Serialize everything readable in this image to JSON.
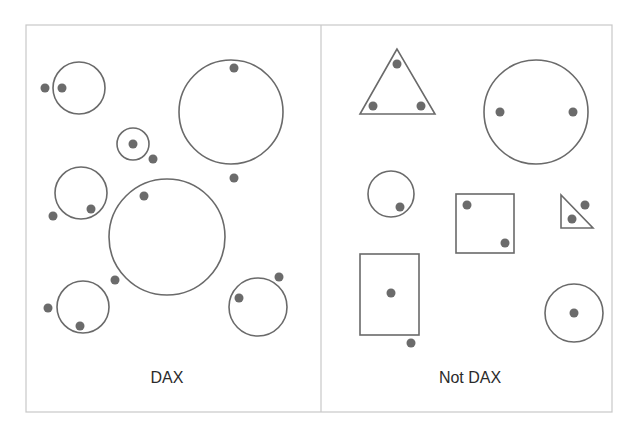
{
  "colors": {
    "stroke": "#6a6a6a",
    "dot": "#6b6b6b",
    "frame": "#c8c8c8",
    "text": "#2b2b2b",
    "background": "#ffffff"
  },
  "frame": {
    "x": 26,
    "y": 25,
    "width": 586,
    "height": 387,
    "divider_x": 321
  },
  "panels": [
    {
      "id": "dax",
      "label": "DAX",
      "shapes": [
        {
          "type": "circle",
          "cx": 79,
          "cy": 88,
          "r": 26
        },
        {
          "type": "circle",
          "cx": 231,
          "cy": 112,
          "r": 52
        },
        {
          "type": "circle",
          "cx": 133,
          "cy": 144,
          "r": 16
        },
        {
          "type": "circle",
          "cx": 81,
          "cy": 193,
          "r": 26
        },
        {
          "type": "circle",
          "cx": 167,
          "cy": 237,
          "r": 58
        },
        {
          "type": "circle",
          "cx": 83,
          "cy": 307,
          "r": 26
        },
        {
          "type": "circle",
          "cx": 258,
          "cy": 307,
          "r": 29
        }
      ],
      "dots": [
        {
          "cx": 45,
          "cy": 88
        },
        {
          "cx": 62,
          "cy": 88
        },
        {
          "cx": 234,
          "cy": 68
        },
        {
          "cx": 234,
          "cy": 178
        },
        {
          "cx": 133,
          "cy": 144
        },
        {
          "cx": 153,
          "cy": 159
        },
        {
          "cx": 91,
          "cy": 209
        },
        {
          "cx": 53,
          "cy": 216
        },
        {
          "cx": 144,
          "cy": 196
        },
        {
          "cx": 115,
          "cy": 280
        },
        {
          "cx": 48,
          "cy": 308
        },
        {
          "cx": 80,
          "cy": 326
        },
        {
          "cx": 279,
          "cy": 277
        },
        {
          "cx": 239,
          "cy": 298
        }
      ]
    },
    {
      "id": "not-dax",
      "label": "Not DAX",
      "shapes": [
        {
          "type": "polygon",
          "points": "397,49 360,114 435,114"
        },
        {
          "type": "circle",
          "cx": 536,
          "cy": 112,
          "r": 52
        },
        {
          "type": "circle",
          "cx": 391,
          "cy": 194,
          "r": 23
        },
        {
          "type": "rect",
          "x": 456,
          "y": 194,
          "width": 58,
          "height": 59
        },
        {
          "type": "polygon",
          "points": "561,195 561,228 593,228"
        },
        {
          "type": "rect",
          "x": 360,
          "y": 254,
          "width": 59,
          "height": 81
        },
        {
          "type": "circle",
          "cx": 574,
          "cy": 313,
          "r": 29
        }
      ],
      "dots": [
        {
          "cx": 397,
          "cy": 64
        },
        {
          "cx": 373,
          "cy": 106
        },
        {
          "cx": 421,
          "cy": 106
        },
        {
          "cx": 500,
          "cy": 112
        },
        {
          "cx": 573,
          "cy": 112
        },
        {
          "cx": 400,
          "cy": 207
        },
        {
          "cx": 467,
          "cy": 205
        },
        {
          "cx": 505,
          "cy": 243
        },
        {
          "cx": 585,
          "cy": 205
        },
        {
          "cx": 572,
          "cy": 219
        },
        {
          "cx": 391,
          "cy": 293
        },
        {
          "cx": 411,
          "cy": 343
        },
        {
          "cx": 574,
          "cy": 313
        }
      ]
    }
  ]
}
